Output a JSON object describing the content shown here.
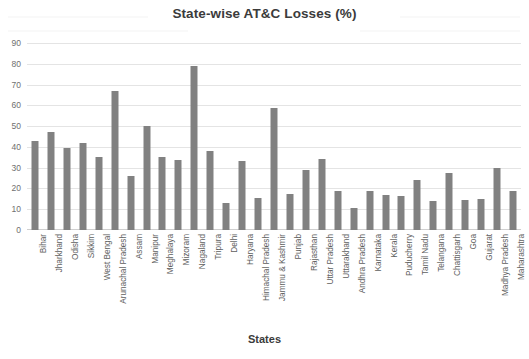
{
  "chart_data": {
    "type": "bar",
    "title": "State-wise AT&C Losses (%)",
    "xlabel": "States",
    "ylabel": "",
    "ylim": [
      0,
      90
    ],
    "yticks": [
      0,
      10,
      20,
      30,
      40,
      50,
      60,
      70,
      80,
      90
    ],
    "grid": true,
    "legend": "none",
    "bar_color": "#818181",
    "categories": [
      "Bihar",
      "Jharkhand",
      "Odisha",
      "Sikkim",
      "West Bengal",
      "Arunachal Pradesh",
      "Assam",
      "Manipur",
      "Meghalaya",
      "Mizoram",
      "Nagaland",
      "Tripura",
      "Delhi",
      "Haryana",
      "Himachal Pradesh",
      "Jammu & Kashmir",
      "Punjab",
      "Rajasthan",
      "Uttar Pradesh",
      "Uttarakhand",
      "Andhra Pradesh",
      "Karnataka",
      "Kerala",
      "Puducherry",
      "Tamil Nadu",
      "Telangana",
      "Chattisgarh",
      "Goa",
      "Gujarat",
      "Madhya Pradesh",
      "Maharashtra"
    ],
    "values": [
      43,
      47,
      39.5,
      42,
      35,
      67,
      26,
      50,
      35,
      33.5,
      79,
      38,
      13,
      33,
      15.5,
      58.5,
      17.5,
      29,
      34,
      19,
      10.5,
      19,
      17,
      16.5,
      24,
      14,
      27.5,
      14.5,
      15,
      30,
      19
    ]
  }
}
